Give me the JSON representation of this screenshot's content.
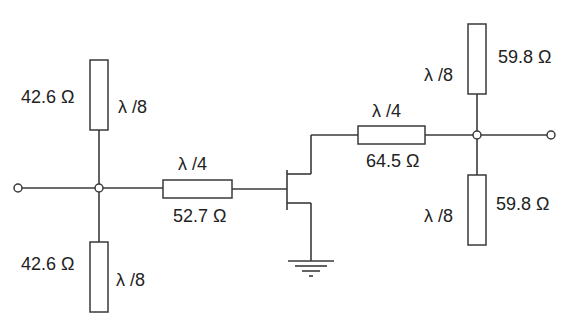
{
  "diagram": {
    "type": "circuit-schematic",
    "input_network": {
      "stub_top": {
        "impedance": "42.6 Ω",
        "length": "λ /8"
      },
      "stub_bottom": {
        "impedance": "42.6 Ω",
        "length": "λ /8"
      },
      "series_line": {
        "impedance": "52.7 Ω",
        "length": "λ /4"
      }
    },
    "output_network": {
      "series_line": {
        "impedance": "64.5 Ω",
        "length": "λ /4"
      },
      "stub_top": {
        "impedance": "59.8 Ω",
        "length": "λ /8"
      },
      "stub_bottom": {
        "impedance": "59.8 Ω",
        "length": "λ /8"
      }
    },
    "device": {
      "name": "FET",
      "source": "ground"
    }
  }
}
